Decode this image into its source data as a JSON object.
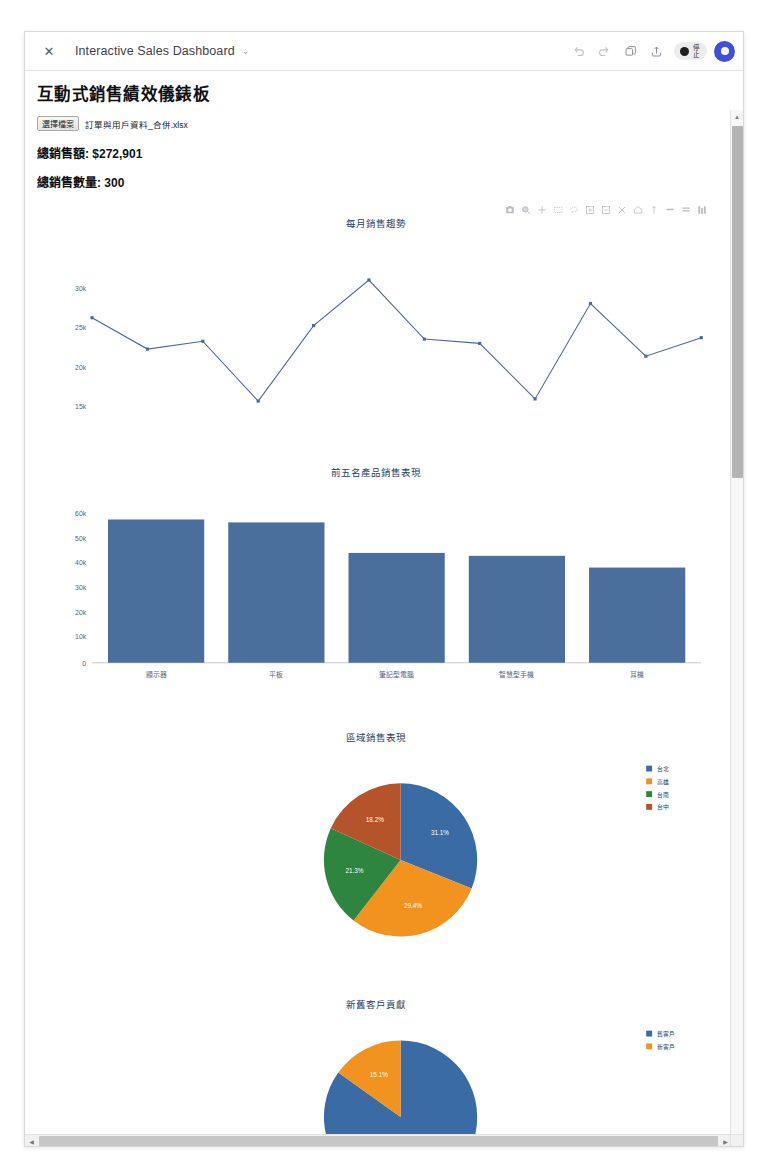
{
  "titlebar": {
    "close_label": "✕",
    "title": "Interactive Sales Dashboard",
    "caret": "⌄",
    "undo_icon": "undo-icon",
    "redo_icon": "redo-icon",
    "copy_icon": "copy-icon",
    "share_icon": "share-upload-icon",
    "stop_label": "停止",
    "avatar_name": "user-avatar"
  },
  "page": {
    "title": "互動式銷售績效儀錶板",
    "file_button": "選擇檔案",
    "file_name": "訂單與用戶資料_合併.xlsx",
    "total_sales": "總銷售額: $272,901",
    "total_qty": "總銷售數量: 300"
  },
  "modebar": {
    "camera": "download-plot-icon",
    "zoom": "zoom-icon",
    "pan": "pan-icon",
    "box_select": "box-select-icon",
    "lasso": "lasso-select-icon",
    "zoom_in": "zoom-in-icon",
    "zoom_out": "zoom-out-icon",
    "autoscale": "autoscale-icon",
    "reset": "reset-axes-icon",
    "spike": "toggle-spike-lines-icon",
    "hover_compare": "hover-compare-icon",
    "hover_closest": "hover-closest-icon",
    "plotly_logo": "plotly-logo-icon"
  },
  "colors": {
    "line": "#4a66a8",
    "bar": "#4a6f9c",
    "pie_blue": "#3b6ba5",
    "pie_orange": "#f2921f",
    "pie_green": "#2e8540",
    "pie_brown": "#b5532a",
    "accent": "#3f4fd6"
  },
  "chart_data": [
    {
      "type": "line",
      "title": "每月銷售趨勢",
      "xlabel": "",
      "ylabel": "",
      "x": [
        1,
        2,
        3,
        4,
        5,
        6,
        7,
        8,
        9,
        10,
        11,
        12
      ],
      "values": [
        26200,
        21800,
        22900,
        14500,
        25100,
        31500,
        23200,
        22600,
        14800,
        28200,
        20800,
        23400
      ],
      "xticks": [
        "2",
        "4",
        "6",
        "8",
        "10",
        "12"
      ],
      "yticks": [
        "15k",
        "20k",
        "25k",
        "30k"
      ],
      "ylim": [
        13000,
        33000
      ],
      "xlim": [
        0.5,
        12.5
      ],
      "grid": false,
      "legend": "none"
    },
    {
      "type": "bar",
      "title": "前五名產品銷售表現",
      "xlabel": "",
      "ylabel": "",
      "categories": [
        "顯示器",
        "平板",
        "筆記型電腦",
        "智慧型手機",
        "耳機"
      ],
      "values": [
        58700,
        57500,
        45000,
        43800,
        39000
      ],
      "yticks": [
        "0",
        "10k",
        "20k",
        "30k",
        "40k",
        "50k",
        "60k"
      ],
      "ylim": [
        0,
        62000
      ],
      "grid": false,
      "legend": "none"
    },
    {
      "type": "pie",
      "title": "區域銷售表現",
      "labels": [
        "台北",
        "高雄",
        "台南",
        "台中"
      ],
      "values": [
        31.1,
        29.4,
        21.3,
        18.2
      ],
      "value_labels": [
        "31.1%",
        "29.4%",
        "21.3%",
        "18.2%"
      ],
      "slice_colors": [
        "#3b6ba5",
        "#f2921f",
        "#2e8540",
        "#b5532a"
      ],
      "legend": "right"
    },
    {
      "type": "pie",
      "title": "新舊客戶貢獻",
      "labels": [
        "舊客戶",
        "新客戶"
      ],
      "values": [
        84.9,
        15.1
      ],
      "value_labels": [
        "84.9%",
        "15.1%"
      ],
      "slice_colors": [
        "#3b6ba5",
        "#f2921f"
      ],
      "legend": "right"
    }
  ],
  "scrollbars": {
    "up_arrow": "▲",
    "down_arrow": "▼",
    "left_arrow": "◀",
    "right_arrow": "▶"
  }
}
